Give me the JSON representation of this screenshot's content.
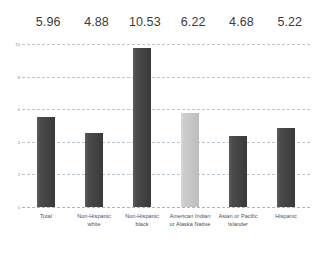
{
  "chart_data": {
    "type": "bar",
    "title": "",
    "subtitle": "",
    "xlabel": "",
    "ylabel": "",
    "ylim": [
      0,
      10.8
    ],
    "yticks": [
      "10",
      "8",
      "6",
      "4",
      "2",
      "0"
    ],
    "grid": true,
    "legend_position": "none",
    "categories": [
      "Total",
      "Non-Hispanic white",
      "Non-Hispanic black",
      "American Indian or Alaska Native",
      "Asian or Pacific Islander",
      "Hispanic"
    ],
    "values": [
      5.96,
      4.88,
      10.53,
      6.22,
      4.68,
      5.22
    ],
    "value_labels": [
      "5.96",
      "4.88",
      "10.53",
      "6.22",
      "4.68",
      "5.22"
    ],
    "bar_colors": [
      "#454545",
      "#454545",
      "#454545",
      "#c8c8c8",
      "#454545",
      "#454545"
    ],
    "colors": {
      "bar_dark": "#454545",
      "bar_light": "#c8c8c8",
      "gridline": "#b9c6cf",
      "value_label_text": "#3b3b3b",
      "tick_text": "#8d8d8d",
      "category_text": "#4f4f4f",
      "background": "#ffffff"
    }
  },
  "axis": {
    "yticks": [
      {
        "label": "10",
        "value": 10
      },
      {
        "label": "8",
        "value": 8
      },
      {
        "label": "6",
        "value": 6
      },
      {
        "label": "4",
        "value": 4
      },
      {
        "label": "2",
        "value": 2
      },
      {
        "label": "0",
        "value": 0
      }
    ]
  },
  "series": [
    {
      "category": "Total",
      "value": 5.96,
      "label": "5.96",
      "shade": "dark"
    },
    {
      "category": "Non-Hispanic white",
      "value": 4.88,
      "label": "4.88",
      "shade": "dark"
    },
    {
      "category": "Non-Hispanic black",
      "value": 10.53,
      "label": "10.53",
      "shade": "dark"
    },
    {
      "category": "American Indian or Alaska Native",
      "value": 6.22,
      "label": "6.22",
      "shade": "light"
    },
    {
      "category": "Asian or Pacific Islander",
      "value": 4.68,
      "label": "4.68",
      "shade": "dark"
    },
    {
      "category": "Hispanic",
      "value": 5.22,
      "label": "5.22",
      "shade": "dark"
    }
  ]
}
